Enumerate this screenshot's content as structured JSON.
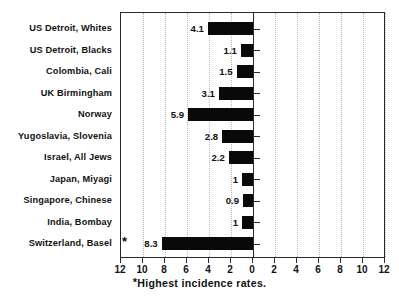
{
  "chart_data": {
    "type": "bar",
    "orientation": "horizontal",
    "title": "",
    "subtitle": "",
    "xlabel": "",
    "ylabel": "",
    "xlim": [
      -12,
      12
    ],
    "xticks": [
      "12",
      "10",
      "8",
      "6",
      "4",
      "2",
      "0",
      "2",
      "4",
      "6",
      "8",
      "10",
      "12"
    ],
    "xtick_values": [
      -12,
      -10,
      -8,
      -6,
      -4,
      -2,
      0,
      2,
      4,
      6,
      8,
      10,
      12
    ],
    "axis_direction_note": "values increase to the left of zero",
    "grid": true,
    "legend": null,
    "categories": [
      "US Detroit, Whites",
      "US Detroit, Blacks",
      "Colombia, Cali",
      "UK Birmingham",
      "Norway",
      "Yugoslavia, Slovenia",
      "Israel, All Jews",
      "Japan, Miyagi",
      "Singapore, Chinese",
      "India, Bombay",
      "Switzerland, Basel"
    ],
    "values": [
      4.1,
      1.1,
      1.5,
      3.1,
      5.9,
      2.8,
      2.2,
      1,
      0.9,
      1,
      8.3
    ],
    "value_labels": [
      "4.1",
      "1.1",
      "1.5",
      "3.1",
      "5.9",
      "2.8",
      "2.2",
      "1",
      "0.9",
      "1",
      "8.3"
    ],
    "annotations": [
      {
        "category": "Switzerland, Basel",
        "marker": "*",
        "meaning": "Highest incidence rates."
      }
    ],
    "footnote": "Highest incidence rates.",
    "footnote_marker": "*",
    "colors": {
      "bar": "#0a0a0a",
      "axis": "#2a2a2a",
      "grid": "#b9b9b9",
      "background": "#ffffff",
      "text": "#111111"
    }
  }
}
